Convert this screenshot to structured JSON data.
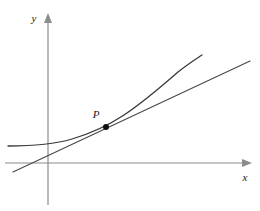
{
  "figure": {
    "background_color": "#ffffff"
  },
  "axes": {
    "x_label": "x",
    "y_label": "y",
    "axis_color": "#8c8c8c",
    "axis_stroke_width": 1.2,
    "x_axis": {
      "name": "x-axis",
      "y_pixel": 163,
      "x_start": 5,
      "x_end": 252,
      "arrow": "right"
    },
    "y_axis": {
      "name": "y-axis",
      "x_pixel": 48,
      "y_start": 205,
      "y_end": 13,
      "arrow": "up"
    },
    "x_label_pos": {
      "x": 243,
      "y": 180
    },
    "y_label_pos": {
      "x": 31,
      "y": 22
    }
  },
  "point": {
    "label": "P",
    "x": 106,
    "y": 127,
    "radius": 3,
    "color": "#111111",
    "label_pos": {
      "x": 96,
      "y": 118
    }
  },
  "curve": {
    "name": "function-curve",
    "color": "#3a3a3a",
    "stroke_width": 1.3,
    "path": "M 8 146 C 30 146, 52 145, 72 139 C 92 133, 106 127, 124 115 C 142 103, 162 86, 178 72 C 188 64, 196 59, 202 55"
  },
  "tangent": {
    "name": "tangent-line",
    "color": "#4a4a4a",
    "stroke_width": 1.2,
    "x1": 13,
    "y1": 172,
    "x2": 250,
    "y2": 61
  },
  "chart_data": {
    "type": "line",
    "xlabel": "x",
    "ylabel": "y",
    "grid": false,
    "legend": null,
    "annotations": [
      {
        "text": "P",
        "x": 106,
        "y": 127,
        "role": "point-of-tangency"
      }
    ],
    "series": [
      {
        "name": "curve",
        "kind": "convex-increasing-curve",
        "points": [
          [
            8,
            146
          ],
          [
            20,
            146
          ],
          [
            32,
            145
          ],
          [
            44,
            144
          ],
          [
            56,
            142
          ],
          [
            68,
            140
          ],
          [
            80,
            136
          ],
          [
            92,
            131
          ],
          [
            104,
            128
          ],
          [
            116,
            120
          ],
          [
            128,
            112
          ],
          [
            140,
            103
          ],
          [
            152,
            94
          ],
          [
            164,
            84
          ],
          [
            176,
            74
          ],
          [
            188,
            64
          ],
          [
            202,
            55
          ]
        ]
      },
      {
        "name": "tangent",
        "kind": "straight-line",
        "points": [
          [
            13,
            172
          ],
          [
            250,
            61
          ]
        ]
      }
    ],
    "note": "Coordinates are in screen pixels; y increases downward."
  }
}
